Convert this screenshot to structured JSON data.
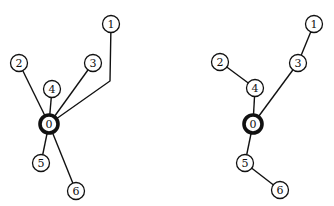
{
  "diagrams": [
    {
      "name": "left-tree",
      "root": "0",
      "nodes": [
        {
          "id": "0",
          "label": "0",
          "x": 49,
          "y": 124,
          "root": true
        },
        {
          "id": "1",
          "label": "1",
          "x": 111,
          "y": 24
        },
        {
          "id": "2",
          "label": "2",
          "x": 19,
          "y": 63
        },
        {
          "id": "3",
          "label": "3",
          "x": 93,
          "y": 63
        },
        {
          "id": "4",
          "label": "4",
          "x": 52,
          "y": 89
        },
        {
          "id": "5",
          "label": "5",
          "x": 41,
          "y": 163
        },
        {
          "id": "6",
          "label": "6",
          "x": 76,
          "y": 191
        }
      ],
      "edges": [
        {
          "from": "0",
          "to": "1",
          "bend": [
            110,
            81
          ]
        },
        {
          "from": "0",
          "to": "2"
        },
        {
          "from": "0",
          "to": "3"
        },
        {
          "from": "0",
          "to": "4"
        },
        {
          "from": "0",
          "to": "5"
        },
        {
          "from": "0",
          "to": "6"
        }
      ]
    },
    {
      "name": "right-tree",
      "root": "0",
      "nodes": [
        {
          "id": "0",
          "label": "0",
          "x": 253,
          "y": 124,
          "root": true
        },
        {
          "id": "1",
          "label": "1",
          "x": 314,
          "y": 24
        },
        {
          "id": "2",
          "label": "2",
          "x": 220,
          "y": 62
        },
        {
          "id": "3",
          "label": "3",
          "x": 298,
          "y": 63
        },
        {
          "id": "4",
          "label": "4",
          "x": 255,
          "y": 88
        },
        {
          "id": "5",
          "label": "5",
          "x": 245,
          "y": 163
        },
        {
          "id": "6",
          "label": "6",
          "x": 280,
          "y": 190
        }
      ],
      "edges": [
        {
          "from": "0",
          "to": "3"
        },
        {
          "from": "3",
          "to": "1"
        },
        {
          "from": "0",
          "to": "4"
        },
        {
          "from": "4",
          "to": "2"
        },
        {
          "from": "0",
          "to": "5"
        },
        {
          "from": "5",
          "to": "6"
        }
      ]
    }
  ],
  "style": {
    "node_radius": 8.5,
    "root_stroke": "#111111",
    "edge_color": "#111111"
  }
}
